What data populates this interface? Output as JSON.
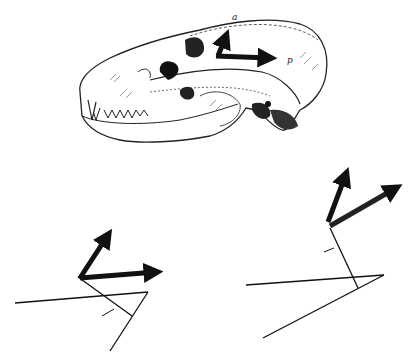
{
  "figure": {
    "skull": {
      "description": "lateral view of carnivore skull",
      "vector_labels": {
        "anterior": "a",
        "posterior": "p"
      }
    },
    "diagrams": [
      {
        "id": "left",
        "description": "force vector diagram with two arrows"
      },
      {
        "id": "right",
        "description": "force vector diagram with two arrows"
      }
    ],
    "colors": {
      "ink": "#111111",
      "background": "#ffffff"
    }
  }
}
